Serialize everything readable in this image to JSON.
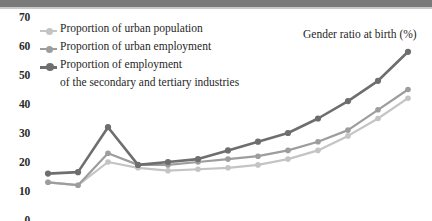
{
  "chart_title": "Gender ratio at birth (%)",
  "y_axis": {
    "ticks": [
      "70",
      "60",
      "50",
      "40",
      "30",
      "20",
      "10",
      "0"
    ],
    "min": 0,
    "max": 70
  },
  "legend": {
    "items": [
      {
        "label": "Proportion of urban population",
        "label_line2": "",
        "color": "#c4c4c4",
        "marker": "line-dot-marker"
      },
      {
        "label": "Proportion of urban employment",
        "label_line2": "",
        "color": "#9d9d9d",
        "marker": "line-dot-marker"
      },
      {
        "label": "Proportion of employment",
        "label_line2": "of the secondary and tertiary industries",
        "color": "#6e6e6e",
        "marker": "line-dot-marker"
      }
    ]
  },
  "chart_data": {
    "type": "line",
    "title": "Gender ratio at birth (%)",
    "xlabel": "",
    "ylabel": "",
    "ylim": [
      0,
      70
    ],
    "grid": false,
    "legend_position": "top-left",
    "x": [
      1,
      2,
      3,
      4,
      5,
      6,
      7,
      8,
      9,
      10,
      11,
      12,
      13
    ],
    "series": [
      {
        "name": "Proportion of urban population",
        "color": "#c4c4c4",
        "values": [
          13,
          12,
          20,
          18,
          17,
          17.5,
          18,
          19,
          21,
          24,
          29,
          35,
          42
        ]
      },
      {
        "name": "Proportion of urban employment",
        "color": "#9d9d9d",
        "values": [
          13,
          12,
          23,
          19,
          19,
          20,
          21,
          22,
          24,
          27,
          31,
          38,
          45
        ]
      },
      {
        "name": "Proportion of employment of the secondary and tertiary industries",
        "color": "#6e6e6e",
        "values": [
          16,
          16.5,
          32,
          19,
          20,
          21,
          24,
          27,
          30,
          35,
          41,
          48,
          58
        ]
      }
    ]
  },
  "colors": {
    "banner": "#7a7a7a",
    "tick_text": "#2b2b2b",
    "label_text": "#1f1f1f",
    "background": "#ffffff"
  }
}
